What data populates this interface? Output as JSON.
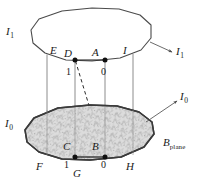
{
  "figure": {
    "background_color": "#ffffff",
    "stroke_color": "#3a3a3a",
    "fill_color": "#d9d9d9",
    "dot_color": "#1a1a1a"
  },
  "labels": {
    "top_left_plane": {
      "base": "I",
      "tilde": "~",
      "sub": "1"
    },
    "top_right_plane": {
      "base": "I",
      "tilde": "~",
      "sub": "1"
    },
    "bottom_left_plane": {
      "base": "I",
      "tilde": "~",
      "sub": "0"
    },
    "bottom_right_plane": {
      "base": "I",
      "tilde": "~",
      "sub": "0"
    },
    "b_plane": {
      "base": "B",
      "sub": "plane"
    }
  },
  "vertices": {
    "top": [
      {
        "name": "E",
        "label": "E"
      },
      {
        "name": "D",
        "label": "D"
      },
      {
        "name": "A",
        "label": "A"
      },
      {
        "name": "I",
        "label": "I"
      }
    ],
    "bottom": [
      {
        "name": "F",
        "label": "F"
      },
      {
        "name": "C",
        "label": "C"
      },
      {
        "name": "B",
        "label": "B"
      },
      {
        "name": "G",
        "label": "G"
      },
      {
        "name": "H",
        "label": "H"
      }
    ]
  },
  "values": {
    "top_one": "1",
    "top_zero": "0",
    "bottom_one": "1",
    "bottom_zero": "0"
  }
}
